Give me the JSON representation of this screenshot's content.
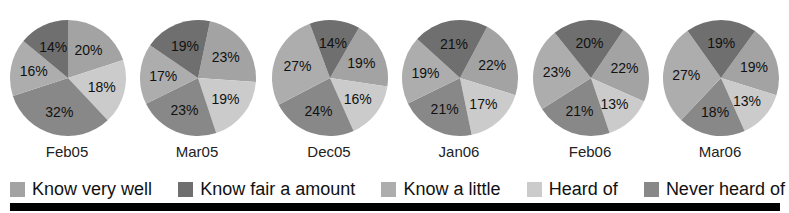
{
  "chart_data": {
    "type": "pie",
    "title": "",
    "categories": [
      "Know very well",
      "Know fair a amount",
      "Know a little",
      "Heard of",
      "Never heard of"
    ],
    "colors": [
      "#a3a3a3",
      "#6f6f6f",
      "#adadad",
      "#cbcbcb",
      "#888888"
    ],
    "draw_order": [
      0,
      3,
      4,
      2,
      1
    ],
    "pies": [
      {
        "label": "Feb05",
        "start_deg": 0,
        "values": [
          20,
          14,
          16,
          18,
          32
        ]
      },
      {
        "label": "Mar05",
        "start_deg": 12,
        "values": [
          23,
          19,
          17,
          19,
          23
        ]
      },
      {
        "label": "Dec05",
        "start_deg": 30,
        "values": [
          19,
          14,
          27,
          16,
          24
        ]
      },
      {
        "label": "Jan06",
        "start_deg": 28,
        "values": [
          22,
          21,
          19,
          17,
          21
        ]
      },
      {
        "label": "Feb06",
        "start_deg": 34,
        "values": [
          22,
          20,
          23,
          13,
          21
        ]
      },
      {
        "label": "Mar06",
        "start_deg": 36,
        "values": [
          19,
          19,
          27,
          13,
          18
        ]
      }
    ],
    "value_suffix": "%",
    "legend_position": "bottom"
  },
  "legend": {
    "items": [
      {
        "label": "Know very well"
      },
      {
        "label": "Know fair a amount"
      },
      {
        "label": "Know a little"
      },
      {
        "label": "Heard of"
      },
      {
        "label": "Never heard of"
      }
    ]
  }
}
